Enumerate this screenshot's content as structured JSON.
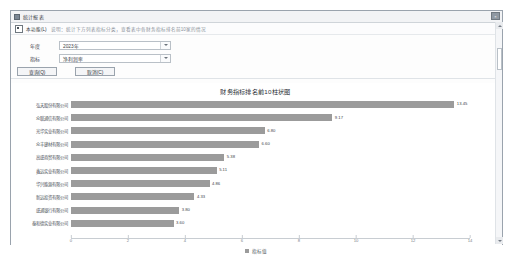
{
  "window": {
    "title": "统计报表",
    "icon": "app-icon",
    "close_label": "×"
  },
  "info": {
    "checkbox_label": "本功能(L)",
    "note": "说明：统计下方列表指标分类，查看表中各财务指标排名前10家的情况"
  },
  "form": {
    "fields": [
      {
        "label": "年度",
        "value": "2023年",
        "caret": "chevron-down-icon"
      },
      {
        "label": "指标",
        "value": "净利润率",
        "caret": "chevron-down-icon"
      }
    ],
    "buttons": [
      {
        "label": "查询(Q)"
      },
      {
        "label": "取消(C)"
      }
    ]
  },
  "chart_data": {
    "type": "bar",
    "orientation": "horizontal",
    "title": "财务指标排名前10柱状图",
    "xlabel": "",
    "ylabel": "",
    "xlim": [
      0,
      14
    ],
    "grid": false,
    "legend_position": "bottom",
    "legend": [
      "指标值"
    ],
    "bar_color": "#9b9b9b",
    "tick_labels": [
      "0",
      "2",
      "4",
      "6",
      "8",
      "10",
      "12",
      "14"
    ],
    "tick_values": [
      0,
      2,
      4,
      6,
      8,
      10,
      12,
      14
    ],
    "categories": [
      "弘天股份有限公司",
      "众联通信有限公司",
      "光华实业有限公司",
      "众丰建材有限公司",
      "高盛商贸有限公司",
      "鑫远实业有限公司",
      "华兴能源有限公司",
      "新远投资有限公司",
      "盛通银行有限公司",
      "泰和德实业有限公司"
    ],
    "values": [
      13.45,
      9.17,
      6.8,
      6.6,
      5.38,
      5.11,
      4.86,
      4.33,
      3.8,
      3.6
    ],
    "value_labels": [
      "13.45",
      "9.17",
      "6.80",
      "6.60",
      "5.38",
      "5.11",
      "4.86",
      "4.33",
      "3.80",
      "3.60"
    ]
  }
}
